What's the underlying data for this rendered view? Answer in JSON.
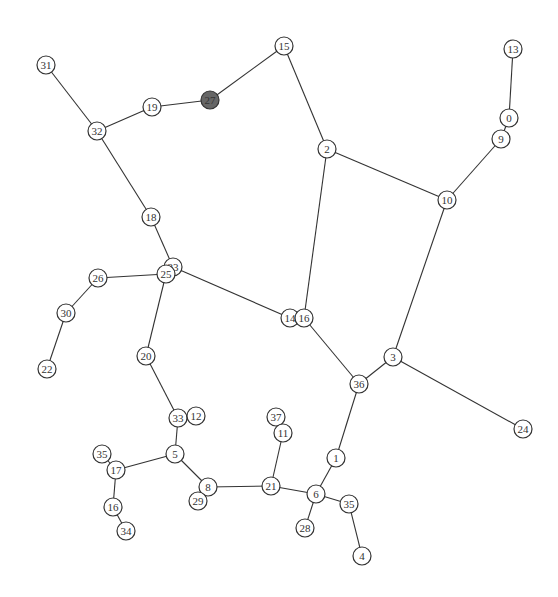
{
  "graph": {
    "node_radius": 9,
    "colors": {
      "edge": "#333333",
      "node_fill": "#ffffff",
      "node_stroke": "#333333",
      "highlight_fill": "#666666"
    },
    "nodes": [
      {
        "id": "31",
        "x": 46,
        "y": 65
      },
      {
        "id": "32",
        "x": 97,
        "y": 131
      },
      {
        "id": "19",
        "x": 152,
        "y": 107
      },
      {
        "id": "27",
        "x": 210,
        "y": 100,
        "highlight": true
      },
      {
        "id": "15",
        "x": 284,
        "y": 46
      },
      {
        "id": "2",
        "x": 327,
        "y": 149
      },
      {
        "id": "13",
        "x": 513,
        "y": 49
      },
      {
        "id": "0",
        "x": 509,
        "y": 118
      },
      {
        "id": "9",
        "x": 501,
        "y": 139
      },
      {
        "id": "10",
        "x": 447,
        "y": 200
      },
      {
        "id": "18",
        "x": 151,
        "y": 217
      },
      {
        "id": "23",
        "x": 173,
        "y": 267
      },
      {
        "id": "25",
        "x": 166,
        "y": 274
      },
      {
        "id": "26",
        "x": 98,
        "y": 278
      },
      {
        "id": "30",
        "x": 66,
        "y": 313
      },
      {
        "id": "22",
        "x": 47,
        "y": 369
      },
      {
        "id": "14",
        "x": 290,
        "y": 318
      },
      {
        "id": "16b",
        "label": "16",
        "x": 304,
        "y": 318
      },
      {
        "id": "20",
        "x": 146,
        "y": 356
      },
      {
        "id": "3",
        "x": 393,
        "y": 357
      },
      {
        "id": "36",
        "x": 359,
        "y": 384
      },
      {
        "id": "24",
        "x": 523,
        "y": 429
      },
      {
        "id": "33",
        "x": 178,
        "y": 418
      },
      {
        "id": "12",
        "x": 196,
        "y": 416
      },
      {
        "id": "37",
        "x": 276,
        "y": 417
      },
      {
        "id": "11",
        "x": 283,
        "y": 433
      },
      {
        "id": "5",
        "x": 175,
        "y": 454
      },
      {
        "id": "35",
        "x": 102,
        "y": 454
      },
      {
        "id": "17",
        "x": 116,
        "y": 470
      },
      {
        "id": "1",
        "x": 336,
        "y": 458
      },
      {
        "id": "8",
        "x": 208,
        "y": 487
      },
      {
        "id": "29",
        "x": 198,
        "y": 501
      },
      {
        "id": "21",
        "x": 271,
        "y": 486
      },
      {
        "id": "6",
        "x": 316,
        "y": 494
      },
      {
        "id": "35b",
        "label": "35",
        "x": 349,
        "y": 504
      },
      {
        "id": "16",
        "x": 113,
        "y": 507
      },
      {
        "id": "28",
        "x": 305,
        "y": 528
      },
      {
        "id": "34",
        "x": 126,
        "y": 531
      },
      {
        "id": "4",
        "x": 362,
        "y": 556
      }
    ],
    "edges": [
      [
        "31",
        "32"
      ],
      [
        "32",
        "19"
      ],
      [
        "19",
        "27"
      ],
      [
        "27",
        "15"
      ],
      [
        "15",
        "2"
      ],
      [
        "2",
        "10"
      ],
      [
        "2",
        "16b"
      ],
      [
        "13",
        "0"
      ],
      [
        "0",
        "9"
      ],
      [
        "9",
        "10"
      ],
      [
        "10",
        "3"
      ],
      [
        "32",
        "18"
      ],
      [
        "18",
        "23"
      ],
      [
        "23",
        "25"
      ],
      [
        "25",
        "26"
      ],
      [
        "26",
        "30"
      ],
      [
        "30",
        "22"
      ],
      [
        "23",
        "14"
      ],
      [
        "14",
        "16b"
      ],
      [
        "16b",
        "36"
      ],
      [
        "36",
        "3"
      ],
      [
        "3",
        "24"
      ],
      [
        "25",
        "20"
      ],
      [
        "20",
        "33"
      ],
      [
        "33",
        "12"
      ],
      [
        "33",
        "5"
      ],
      [
        "5",
        "17"
      ],
      [
        "17",
        "35"
      ],
      [
        "17",
        "16"
      ],
      [
        "16",
        "34"
      ],
      [
        "5",
        "8"
      ],
      [
        "8",
        "29"
      ],
      [
        "8",
        "21"
      ],
      [
        "21",
        "11"
      ],
      [
        "11",
        "37"
      ],
      [
        "21",
        "6"
      ],
      [
        "6",
        "1"
      ],
      [
        "1",
        "36"
      ],
      [
        "6",
        "28"
      ],
      [
        "6",
        "35b"
      ],
      [
        "35b",
        "4"
      ]
    ]
  }
}
